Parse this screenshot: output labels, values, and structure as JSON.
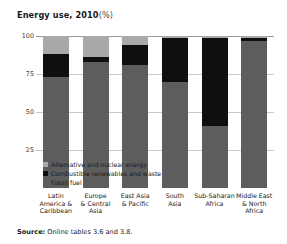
{
  "chart_data": {
    "type": "bar",
    "stacked": true,
    "title_main": "Energy use, 2010",
    "title_unit": "(%)",
    "xlabel": "",
    "ylabel": "",
    "ylim": [
      0,
      100
    ],
    "yticks": [
      100,
      75,
      50,
      25
    ],
    "grid": true,
    "legend_position": "inside-bottom-left",
    "categories": [
      "Latin America & Caribbean",
      "Europe & Central Asia",
      "East Asia & Pacific",
      "South Asia",
      "Sub-Saharan Africa",
      "Middle East & North Africa"
    ],
    "categories_wrapped": [
      "Latin\nAmerica &\nCaribbean",
      "Europe\n& Central\nAsia",
      "East Asia\n& Pacific",
      "South\nAsia",
      "Sub-Saharan\nAfrica",
      "Middle East\n& North\nAfrica"
    ],
    "series": [
      {
        "name": "Fossil fuel",
        "color": "#5d5d5d",
        "values": [
          73,
          83,
          81,
          70,
          41,
          97
        ]
      },
      {
        "name": "Combustible renewables and waste",
        "color": "#100f0f",
        "values": [
          15,
          3,
          13,
          29,
          58,
          2
        ]
      },
      {
        "name": "Alternative and nuclear energy",
        "color": "#a9a9a9",
        "values": [
          12,
          14,
          6,
          1,
          1,
          1
        ]
      }
    ],
    "legend_order": [
      "Alternative and nuclear energy",
      "Combustible renewables and waste",
      "Fossil fuel"
    ]
  },
  "source": {
    "label": "Source:",
    "text": "Online tables 3.6 and 3.8."
  }
}
